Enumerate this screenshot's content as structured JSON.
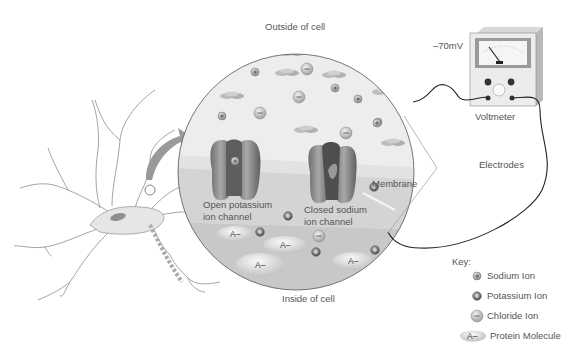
{
  "diagram": {
    "labels": {
      "outside": "Outside of cell",
      "inside": "Inside of cell",
      "membrane": "Membrane",
      "open_channel_line1": "Open potassium",
      "open_channel_line2": "ion channel",
      "closed_channel_line1": "Closed sodium",
      "closed_channel_line2": "ion channel",
      "voltage": "–70mV",
      "voltmeter": "Voltmeter",
      "electrodes": "Electrodes"
    },
    "protein_symbol": "A–"
  },
  "key": {
    "title": "Key:",
    "items": [
      {
        "symbol": "sodium",
        "label": "Sodium Ion"
      },
      {
        "symbol": "potassium",
        "label": "Potassium Ion"
      },
      {
        "symbol": "chloride",
        "label": "Chloride Ion"
      },
      {
        "symbol": "protein",
        "label": "Protein Molecule",
        "glyph": "A–"
      }
    ]
  },
  "colors": {
    "outside_fluid": "#ececec",
    "membrane_light": "#dcdcdc",
    "inside_fluid": "#c4c4c4",
    "channel": "#8a8a8a",
    "neuron": "#e4e4e4",
    "arrow": "#9a9a9a"
  }
}
